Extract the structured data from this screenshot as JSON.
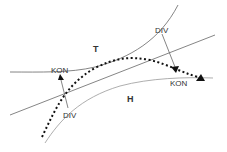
{
  "diagram": {
    "regions": [
      {
        "id": "upper",
        "label": "T"
      },
      {
        "id": "lower",
        "label": "H"
      }
    ],
    "labels": {
      "kon_left": "KON",
      "div_left": "DIV",
      "div_right": "DIV",
      "kon_right": "KON"
    },
    "colors": {
      "line": "#555555",
      "path": "#111111"
    }
  }
}
